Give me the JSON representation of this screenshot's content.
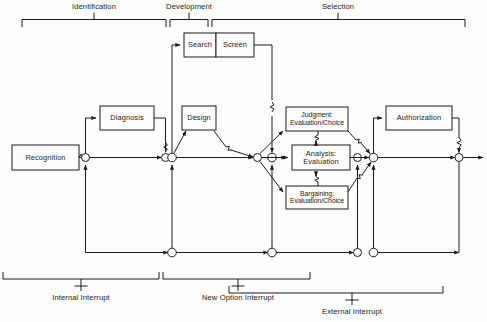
{
  "diagram": {
    "type": "flow-diagram",
    "stroke_color": "#1b1b1b",
    "background": "#fdfdfb"
  },
  "phases": [
    {
      "id": "identification",
      "label": "Identification"
    },
    {
      "id": "development",
      "label": "Development"
    },
    {
      "id": "selection",
      "label": "Selection"
    }
  ],
  "boxes": [
    {
      "id": "recognition",
      "label": "Recognition"
    },
    {
      "id": "diagnosis",
      "label": "Diagnosis"
    },
    {
      "id": "search",
      "label": "Search"
    },
    {
      "id": "screen",
      "label": "Screen"
    },
    {
      "id": "design",
      "label": "Design"
    },
    {
      "id": "judgment",
      "label": "Judgment:\nEvaluation/Choice"
    },
    {
      "id": "analysis",
      "label": "Analysis:\nEvaluation"
    },
    {
      "id": "bargaining",
      "label": "Bargaining:\nEvaluation/Choice"
    },
    {
      "id": "authorization",
      "label": "Authorization"
    }
  ],
  "interrupts": [
    {
      "id": "internal-interrupt",
      "label": "Internal Interrupt"
    },
    {
      "id": "new-option-interrupt",
      "label": "New Option Interrupt"
    },
    {
      "id": "external-interrupt",
      "label": "External Interrupt"
    }
  ]
}
